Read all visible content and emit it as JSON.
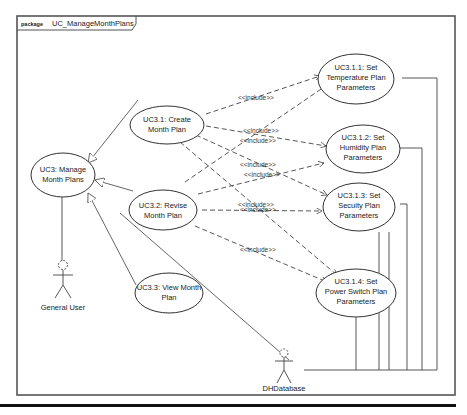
{
  "frame": {
    "keyword": "package",
    "name": "UC_ManageMonthPlans"
  },
  "use_cases": {
    "uc3": [
      "UC3: Manage",
      "Month Plans"
    ],
    "uc31": [
      "UC3.1: Create",
      "Month Plan"
    ],
    "uc32": [
      "UC3.2: Revise",
      "Month Plan"
    ],
    "uc33": [
      "UC3.3: View Month",
      "Plan"
    ],
    "uc311": [
      "UC3.1.1: Set",
      "Temperature Plan",
      "Parameters"
    ],
    "uc312": [
      "UC3.1.2: Set",
      "Humidity Plan",
      "Parameters"
    ],
    "uc313": [
      "UC3.1.3: Set",
      "Secuity Plan",
      "Parameters"
    ],
    "uc314": [
      "UC3.1.4: Set",
      "Power Switch Plan",
      "Parameters"
    ]
  },
  "actors": {
    "general_user": "General User",
    "dhdatabase": "DHDatabase"
  },
  "stereotype": "<<include>>"
}
